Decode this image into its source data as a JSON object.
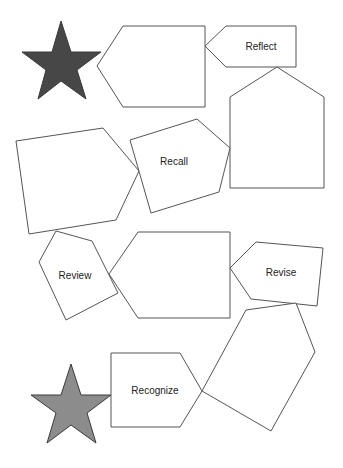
{
  "diagram": {
    "title": "",
    "colors": {
      "star_top": "#474747",
      "star_bottom": "#8c8c8c",
      "outline": "#555555",
      "background": "#ffffff"
    },
    "stars": [
      {
        "id": "star-top",
        "points": "61,21 71,52 101,52 77,70 86,99 61,81 38,99 46,70 22,52 52,52"
      },
      {
        "id": "star-bottom",
        "points": "71,364 81,395 111,395 87,413 96,443 71,425 47,443 56,413 31,395 61,395"
      }
    ],
    "shapes": [
      {
        "id": "hexagon-top-blank",
        "label": "",
        "points": "97,66 123,26 205,26 205,107 123,107",
        "lx": 160,
        "ly": 66
      },
      {
        "id": "reflect",
        "label": "Reflect",
        "points": "205,46 226,26 296,26 296,67 226,67",
        "lx": 257,
        "ly": 45
      },
      {
        "id": "tall-pentagon-blank",
        "label": "",
        "points": "277,67 324,97 324,188 230,188 230,97",
        "lx": 277,
        "ly": 140
      },
      {
        "id": "left-pentagon-blank",
        "label": "",
        "points": "16,141 103,128 139,171 116,220 29,234",
        "lx": 75,
        "ly": 180
      },
      {
        "id": "recall",
        "label": "Recall",
        "points": "130,140 197,119 230,148 219,192 151,213",
        "lx": 173,
        "ly": 162
      },
      {
        "id": "review",
        "label": "Review",
        "points": "56,231 92,241 118,293 66,320 39,262",
        "lx": 74,
        "ly": 277
      },
      {
        "id": "hexagon-middle-blank",
        "label": "",
        "points": "109,274 138,232 230,232 230,318 138,318",
        "lx": 175,
        "ly": 275
      },
      {
        "id": "revise",
        "label": "Revise",
        "points": "230,268 256,242 323,248 317,306 251,299",
        "lx": 281,
        "ly": 272
      },
      {
        "id": "bottom-pentagon-blank",
        "label": "",
        "points": "246,310 296,303 315,352 271,431 202,391",
        "lx": 260,
        "ly": 360
      },
      {
        "id": "recognize",
        "label": "Recognize",
        "points": "111,353 180,353 202,391 180,427 111,427",
        "lx": 155,
        "ly": 391
      }
    ]
  }
}
